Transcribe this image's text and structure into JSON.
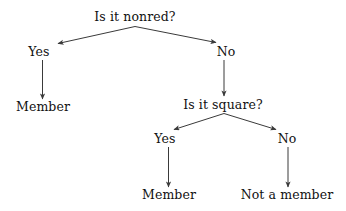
{
  "diagram": {
    "type": "decision-tree",
    "background_color": "#ffffff",
    "line_color": "#3a3a3a",
    "text_color": "#111111"
  },
  "nodes": {
    "root_question": "Is it nonred?",
    "branch_yes_1": "Yes",
    "branch_no_1": "No",
    "leaf_member_1": "Member",
    "second_question": "Is it square?",
    "branch_yes_2": "Yes",
    "branch_no_2": "No",
    "leaf_member_2": "Member",
    "leaf_not_member": "Not a member"
  },
  "tree_structure": {
    "question": "Is it nonred?",
    "branches": [
      {
        "answer": "Yes",
        "result": "Member"
      },
      {
        "answer": "No",
        "child": {
          "question": "Is it square?",
          "branches": [
            {
              "answer": "Yes",
              "result": "Member"
            },
            {
              "answer": "No",
              "result": "Not a member"
            }
          ]
        }
      }
    ]
  }
}
